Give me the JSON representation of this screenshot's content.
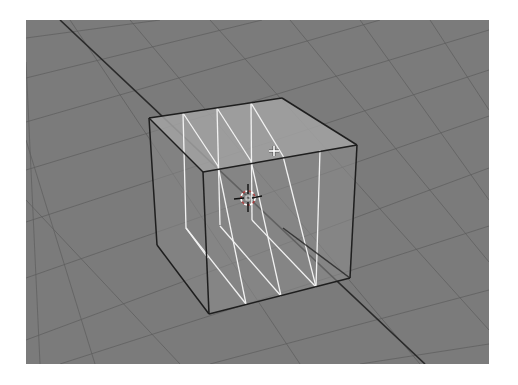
{
  "viewport": {
    "x": 26,
    "y": 20,
    "width": 463,
    "height": 344,
    "background": "#7b7b7b",
    "page_background": "#ffffff",
    "shading": "wireframe-xray",
    "grid": {
      "color": "#5f5f5f",
      "opacity": 0.75,
      "width": 1,
      "lines_family_a": [
        [
          [
            26,
            38
          ],
          [
            160,
            20
          ]
        ],
        [
          [
            26,
            78
          ],
          [
            262,
            20
          ]
        ],
        [
          [
            26,
            122
          ],
          [
            380,
            20
          ]
        ],
        [
          [
            26,
            170
          ],
          [
            489,
            30
          ]
        ],
        [
          [
            26,
            222
          ],
          [
            489,
            70
          ]
        ],
        [
          [
            26,
            278
          ],
          [
            489,
            116
          ]
        ],
        [
          [
            26,
            340
          ],
          [
            489,
            168
          ]
        ],
        [
          [
            60,
            364
          ],
          [
            489,
            226
          ]
        ],
        [
          [
            210,
            364
          ],
          [
            489,
            290
          ]
        ],
        [
          [
            360,
            364
          ],
          [
            489,
            344
          ]
        ]
      ],
      "lines_family_b": [
        [
          [
            26,
            62
          ],
          [
            40,
            364
          ]
        ],
        [
          [
            26,
            140
          ],
          [
            95,
            364
          ]
        ],
        [
          [
            26,
            200
          ],
          [
            180,
            364
          ]
        ],
        [
          [
            70,
            20
          ],
          [
            300,
            364
          ]
        ],
        [
          [
            130,
            20
          ],
          [
            420,
            364
          ]
        ],
        [
          [
            210,
            20
          ],
          [
            489,
            330
          ]
        ],
        [
          [
            290,
            20
          ],
          [
            489,
            262
          ]
        ],
        [
          [
            360,
            20
          ],
          [
            489,
            200
          ]
        ],
        [
          [
            430,
            20
          ],
          [
            489,
            110
          ]
        ]
      ]
    },
    "axis_line": {
      "color": "#2a2a2a",
      "width": 1.6,
      "from": [
        60,
        20
      ],
      "to": [
        425,
        364
      ]
    },
    "cube": {
      "name": "Cube",
      "edge_color": "#1e1e1e",
      "edge_width": 1.5,
      "loopcut_color": "#f2f2f2",
      "loopcut_width": 1.3,
      "top_face_fill": "#a3a3a3",
      "front_face_fill": "#8e8e8e",
      "side_face_fill": "#888888",
      "face_opacity": 0.55,
      "vertices": {
        "top_left": [
          149,
          118
        ],
        "top_back": [
          282,
          98
        ],
        "top_right": [
          357,
          145
        ],
        "top_front": [
          203,
          172
        ],
        "bottom_left": [
          157,
          245
        ],
        "bottom_front": [
          209,
          314
        ],
        "bottom_right": [
          350,
          278
        ],
        "bottom_back": [
          283,
          228
        ]
      },
      "loop_cuts": [
        {
          "top_back": [
            183,
            113
          ],
          "top_front": [
            218,
            166
          ],
          "bottom_front": [
            246,
            304
          ],
          "bottom_side": [
            192,
            237
          ]
        },
        {
          "top_back": [
            217,
            108
          ],
          "top_front": [
            251,
            161
          ],
          "bottom_front": [
            281,
            296
          ],
          "bottom_side": [
            222,
            230
          ]
        },
        {
          "top_back": [
            251,
            103
          ],
          "top_front": [
            283,
            156
          ],
          "bottom_front": [
            316,
            287
          ],
          "bottom_side": [
            253,
            224
          ]
        },
        {
          "top_back": [
            282,
            98
          ],
          "top_front": [
            320,
            150
          ],
          "bottom_front": [
            316,
            287
          ],
          "bottom_side": [
            316,
            287
          ]
        }
      ],
      "front_loop_verticals": [
        [
          [
            218,
            166
          ],
          [
            246,
            304
          ]
        ],
        [
          [
            251,
            161
          ],
          [
            281,
            296
          ]
        ],
        [
          [
            283,
            156
          ],
          [
            316,
            287
          ]
        ],
        [
          [
            320,
            150
          ],
          [
            316,
            287
          ]
        ]
      ]
    },
    "cursor_3d": {
      "center": [
        248,
        198
      ],
      "ring_radius": 7,
      "ring_colors": [
        "#ffffff",
        "#cc2222"
      ],
      "crosshair_color": "#111111",
      "arm_length": 14
    },
    "mouse_cursor": {
      "type": "crosshair-plus",
      "center": [
        274,
        151
      ],
      "color": "#ffffff",
      "size": 5
    }
  }
}
